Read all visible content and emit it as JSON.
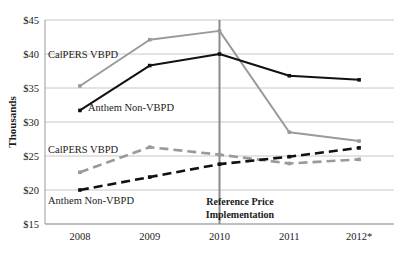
{
  "chart_data": {
    "type": "line",
    "title": "",
    "xlabel": "",
    "ylabel": "Thousands",
    "categories": [
      "2008",
      "2009",
      "2010",
      "2011",
      "2012*"
    ],
    "ylim": [
      15,
      45
    ],
    "ytick_labels": [
      "$45",
      "$40",
      "$35",
      "$30",
      "$25",
      "$20",
      "$15"
    ],
    "ytick_values": [
      45,
      40,
      35,
      30,
      25,
      20,
      15
    ],
    "grid": true,
    "legend_position": "inline-labels",
    "series": [
      {
        "name": "CalPERS VBPD",
        "group": "upper",
        "color": "#9a9a9a",
        "style": "solid",
        "values": [
          35.3,
          42.1,
          43.4,
          28.5,
          27.2
        ]
      },
      {
        "name": "Anthem Non-VBPD",
        "group": "upper",
        "color": "#111111",
        "style": "solid",
        "values": [
          31.7,
          38.3,
          40.0,
          36.8,
          36.2
        ]
      },
      {
        "name": "CalPERS VBPD",
        "group": "lower",
        "color": "#9a9a9a",
        "style": "dashed",
        "values": [
          22.6,
          26.3,
          25.2,
          23.9,
          24.5
        ]
      },
      {
        "name": "Anthem Non-VBPD",
        "group": "lower",
        "color": "#111111",
        "style": "dashed",
        "values": [
          20.0,
          21.9,
          23.8,
          24.9,
          26.2
        ]
      }
    ],
    "annotations": [
      {
        "name": "reference-price-line",
        "type": "vline",
        "x_category": "2010",
        "color": "#8a8a8a",
        "label_line_1": "Reference Price",
        "label_line_2": "Implementation"
      }
    ],
    "series_labels": [
      {
        "text": "CalPERS VBPD",
        "anchor": "upper-gray"
      },
      {
        "text": "Anthem Non-VBPD",
        "anchor": "upper-black"
      },
      {
        "text": "CalPERS VBPD",
        "anchor": "lower-gray"
      },
      {
        "text": "Anthem Non-VBPD",
        "anchor": "lower-black"
      }
    ]
  }
}
